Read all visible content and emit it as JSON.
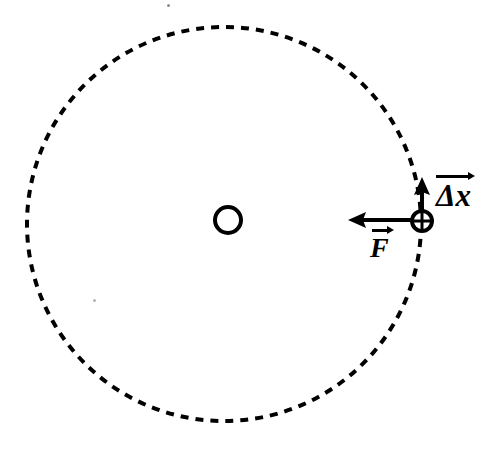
{
  "figure": {
    "background_color": "#ffffff",
    "stroke_color": "#000000",
    "width": 488,
    "height": 455
  },
  "orbit_circle": {
    "name": "dashed-orbit-path",
    "center_x": 224,
    "center_y": 224,
    "radius": 197,
    "stroke_width": 4,
    "dash_length": 8,
    "gap_length": 7,
    "style": "dashed"
  },
  "center_body": {
    "name": "central-mass",
    "center_x": 228,
    "center_y": 220,
    "radius": 13,
    "stroke_width": 4,
    "fill": "none"
  },
  "orbiting_body": {
    "name": "orbiting-particle",
    "center_x": 422,
    "center_y": 221,
    "radius": 10,
    "stroke_width": 4,
    "fill": "none"
  },
  "vectors": [
    {
      "id": "displacement",
      "label": "Δx",
      "label_text": "Δx",
      "direction": "up",
      "tail_x": 422,
      "tail_y": 221,
      "tip_x": 422,
      "tip_y": 178,
      "length": 43,
      "stroke_width": 4,
      "label_x": 436,
      "label_y": 172,
      "has_overset_arrow": true
    },
    {
      "id": "force",
      "label": "F",
      "label_text": "F",
      "direction": "left",
      "tail_x": 422,
      "tail_y": 220,
      "tip_x": 350,
      "tip_y": 220,
      "length": 72,
      "stroke_width": 4,
      "label_x": 370,
      "label_y": 226,
      "has_overset_arrow": true
    }
  ],
  "specks": [
    {
      "id": "speck-top",
      "x": 167,
      "y": 4,
      "size": 3
    },
    {
      "id": "speck-left",
      "x": 93,
      "y": 299,
      "size": 3
    }
  ]
}
